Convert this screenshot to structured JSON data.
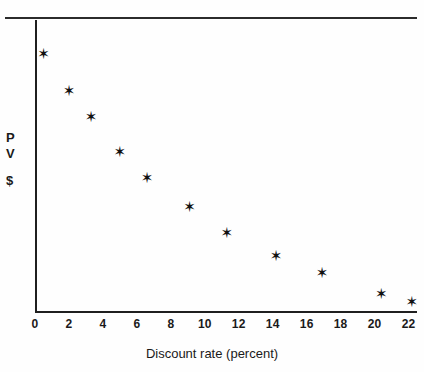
{
  "chart_data": {
    "type": "scatter",
    "title": "",
    "subtitle": "",
    "xlabel": "Discount rate (percent)",
    "ylabel": "PV $",
    "ylabel_lines": [
      "P",
      "V",
      "$"
    ],
    "xlim": [
      0,
      22.5
    ],
    "ylim": [
      0,
      100
    ],
    "grid": false,
    "legend": null,
    "marker": "star",
    "marker_color": "#111111",
    "xticks": [
      0,
      2,
      4,
      6,
      8,
      10,
      12,
      14,
      16,
      18,
      20,
      22
    ],
    "xtick_labels": [
      "0",
      "2",
      "4",
      "6",
      "8",
      "10",
      "12",
      "14",
      "16",
      "18",
      "20",
      "22"
    ],
    "yticks": [],
    "ytick_labels": [],
    "points": [
      {
        "x": 0.5,
        "y": 89
      },
      {
        "x": 2.0,
        "y": 76
      },
      {
        "x": 3.3,
        "y": 67
      },
      {
        "x": 5.0,
        "y": 55
      },
      {
        "x": 6.6,
        "y": 46
      },
      {
        "x": 9.1,
        "y": 36
      },
      {
        "x": 11.3,
        "y": 27
      },
      {
        "x": 14.2,
        "y": 19
      },
      {
        "x": 16.9,
        "y": 13
      },
      {
        "x": 20.4,
        "y": 6
      },
      {
        "x": 22.2,
        "y": 3
      }
    ]
  },
  "figure": {
    "top_rule": "horizontal-rule",
    "x_axis": "x-axis",
    "y_axis": "y-axis"
  }
}
